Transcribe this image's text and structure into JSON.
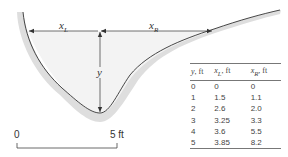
{
  "figure": {
    "labels": {
      "x_left": {
        "main": "x",
        "sub": "L"
      },
      "x_right": {
        "main": "x",
        "sub": "R"
      },
      "depth": "y"
    },
    "scale_bar": {
      "start": "0",
      "end": "5 ft"
    },
    "colors": {
      "water_fill": "#f2f2f2",
      "bank_shade": "#dcdcdc",
      "line": "#333333"
    }
  },
  "table": {
    "headers": [
      {
        "var": "y",
        "sub": "",
        "unit": ", ft"
      },
      {
        "var": "x",
        "sub": "L",
        "unit": ", ft"
      },
      {
        "var": "x",
        "sub": "R",
        "unit": ", ft"
      }
    ],
    "rows": [
      [
        "0",
        "0",
        "0"
      ],
      [
        "1",
        "1.5",
        "1.1"
      ],
      [
        "2",
        "2.6",
        "2.0"
      ],
      [
        "3",
        "3.25",
        "3.3"
      ],
      [
        "4",
        "3.6",
        "5.5"
      ],
      [
        "5",
        "3.85",
        "8.2"
      ]
    ]
  }
}
